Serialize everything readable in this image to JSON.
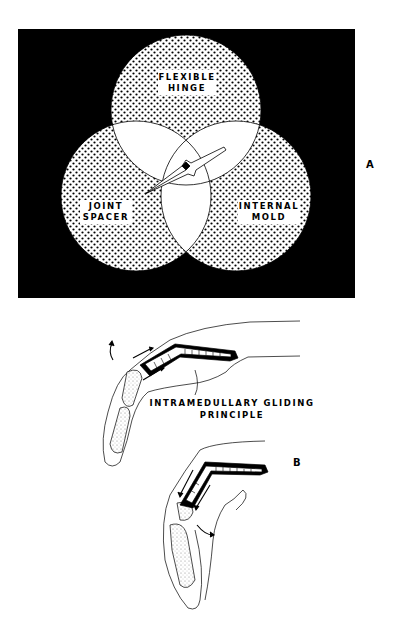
{
  "figure_a": {
    "panel_label": "A",
    "circles": [
      {
        "id": "top",
        "label_line1": "FLEXIBLE",
        "label_line2": "HINGE"
      },
      {
        "id": "left",
        "label_line1": "JOINT",
        "label_line2": "SPACER"
      },
      {
        "id": "right",
        "label_line1": "INTERNAL",
        "label_line2": "MOLD"
      }
    ],
    "background_color": "#000000",
    "fill_pattern": "dotted"
  },
  "figure_b": {
    "panel_label": "B",
    "caption_line1": "INTRAMEDULLARY GLIDING",
    "caption_line2": "PRINCIPLE"
  }
}
